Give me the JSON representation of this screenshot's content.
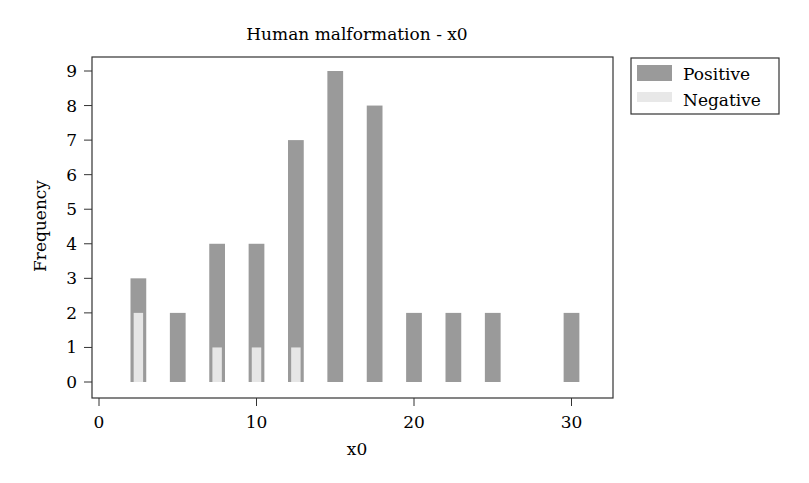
{
  "chart_data": {
    "type": "bar",
    "title": "Human malformation - x0",
    "xlabel": "x0",
    "ylabel": "Frequency",
    "xlim": [
      -0.5,
      32.8
    ],
    "ylim": [
      -0.45,
      9.45
    ],
    "xticks": [
      0,
      10,
      20,
      30
    ],
    "yticks": [
      0,
      1,
      2,
      3,
      4,
      5,
      6,
      7,
      8,
      9
    ],
    "grid": false,
    "legend_position": "right-top",
    "bar_width_units": 1.0,
    "x": [
      2.5,
      5,
      7.5,
      10,
      12.5,
      15,
      17.5,
      20,
      22.5,
      25,
      30
    ],
    "series": [
      {
        "name": "Positive",
        "color": "#9a9a9a",
        "values": [
          3,
          2,
          4,
          4,
          7,
          9,
          8,
          2,
          2,
          2,
          2
        ]
      },
      {
        "name": "Negative",
        "color": "#e6e6e6",
        "values": [
          2,
          0,
          1,
          1,
          1,
          0,
          0,
          0,
          0,
          0,
          0
        ]
      }
    ]
  },
  "legend": {
    "items": [
      {
        "label": "Positive",
        "color": "#9a9a9a"
      },
      {
        "label": "Negative",
        "color": "#e8e8e8"
      }
    ]
  }
}
